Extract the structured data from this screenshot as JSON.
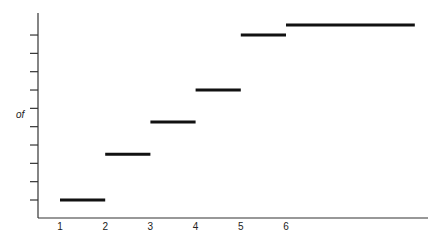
{
  "chart_data": {
    "type": "line",
    "subtype": "step",
    "title": "",
    "xlabel": "",
    "ylabel": "of",
    "x_ticks": [
      "1",
      "2",
      "3",
      "4",
      "5",
      "6"
    ],
    "y_ticks_count": 10,
    "y_tick_labels": [],
    "xlim": [
      1,
      8.9
    ],
    "ylim": [
      0,
      10.9
    ],
    "grid": false,
    "legend": null,
    "series": [
      {
        "name": "step function",
        "color": "#111111",
        "segments": [
          {
            "x_start": 1,
            "x_end": 2,
            "y": 1.0
          },
          {
            "x_start": 2,
            "x_end": 3,
            "y": 3.5
          },
          {
            "x_start": 3,
            "x_end": 4,
            "y": 5.25
          },
          {
            "x_start": 4,
            "x_end": 5,
            "y": 7.0
          },
          {
            "x_start": 5,
            "x_end": 6,
            "y": 10.0
          },
          {
            "x_start": 6,
            "x_end": 8.85,
            "y": 10.55
          }
        ]
      }
    ]
  },
  "colors": {
    "axis": "#333333",
    "line": "#111111",
    "text": "#222222",
    "background": "#ffffff"
  }
}
